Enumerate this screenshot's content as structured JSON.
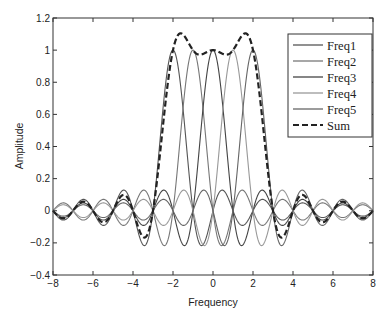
{
  "chart_data": {
    "type": "line",
    "title": "",
    "xlabel": "Frequency",
    "ylabel": "Amplitude",
    "xlim": [
      -8,
      8
    ],
    "ylim": [
      -0.4,
      1.2
    ],
    "xticks": [
      -8,
      -6,
      -4,
      -2,
      0,
      2,
      4,
      6,
      8
    ],
    "xtick_labels": [
      "−8",
      "−6",
      "−4",
      "−2",
      "0",
      "2",
      "4",
      "6",
      "8"
    ],
    "yticks": [
      -0.4,
      -0.2,
      0,
      0.2,
      0.4,
      0.6,
      0.8,
      1,
      1.2
    ],
    "ytick_labels": [
      "−0.4",
      "−0.2",
      "0",
      "0.2",
      "0.4",
      "0.6",
      "0.8",
      "1",
      "1.2"
    ],
    "grid": false,
    "legend_position": "upper right",
    "series": [
      {
        "name": "Freq1",
        "style": "solid",
        "color": "#555555",
        "center": -2,
        "peak": 1.0
      },
      {
        "name": "Freq2",
        "style": "solid",
        "color": "#777777",
        "center": -1,
        "peak": 1.0
      },
      {
        "name": "Freq3",
        "style": "solid",
        "color": "#444444",
        "center": 0,
        "peak": 1.0
      },
      {
        "name": "Freq4",
        "style": "solid",
        "color": "#999999",
        "center": 1,
        "peak": 1.0
      },
      {
        "name": "Freq5",
        "style": "solid",
        "color": "#666666",
        "center": 2,
        "peak": 1.0
      },
      {
        "name": "Sum",
        "style": "dashed",
        "color": "#222222",
        "peaks": [
          {
            "x": -1.7,
            "y": 1.1
          },
          {
            "x": -0.5,
            "y": 1.0
          },
          {
            "x": 0.5,
            "y": 1.0
          },
          {
            "x": 1.7,
            "y": 1.1
          }
        ]
      }
    ]
  },
  "legend": {
    "items": [
      "Freq1",
      "Freq2",
      "Freq3",
      "Freq4",
      "Freq5",
      "Sum"
    ]
  },
  "axes": {
    "xlabel": "Frequency",
    "ylabel": "Amplitude"
  }
}
